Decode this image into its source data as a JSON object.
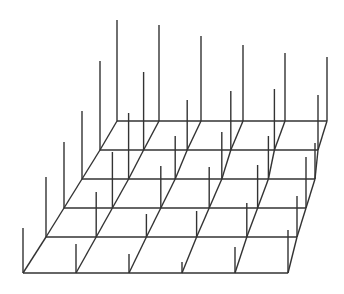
{
  "diagram": {
    "type": "oblique-grid-spike-plot",
    "stroke_color": "#333333",
    "background": "#ffffff",
    "grid_rows": 6,
    "grid_cols": 6,
    "rows": [
      {
        "y": 121,
        "x_left": 117,
        "x_right": 327,
        "spike_tops": [
          20,
          25,
          36,
          45,
          53,
          57
        ]
      },
      {
        "y": 150,
        "x_left": 100,
        "x_right": 318,
        "spike_tops": [
          61,
          72,
          100,
          91,
          89,
          95
        ]
      },
      {
        "y": 179,
        "x_left": 82,
        "x_right": 315,
        "spike_tops": [
          111,
          113,
          136,
          132,
          136,
          143
        ]
      },
      {
        "y": 208,
        "x_left": 64,
        "x_right": 306,
        "spike_tops": [
          142,
          152,
          166,
          167,
          165,
          157
        ]
      },
      {
        "y": 237,
        "x_left": 46,
        "x_right": 297,
        "spike_tops": [
          177,
          192,
          214,
          211,
          203,
          196
        ]
      },
      {
        "y": 273,
        "x_left": 23,
        "x_right": 288,
        "spike_tops": [
          228,
          244,
          254,
          262,
          247,
          230
        ]
      }
    ]
  }
}
